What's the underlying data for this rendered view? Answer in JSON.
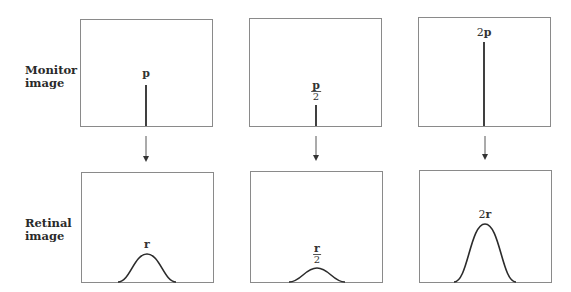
{
  "labels": {
    "monitor": [
      "Monitor",
      "image"
    ],
    "retinal": [
      "Retinal",
      "image"
    ]
  },
  "monitor_panels": [
    {
      "label_var": "p",
      "label_prefix": "",
      "label_denominator": "",
      "spike_x": 146,
      "spike_top": 85
    },
    {
      "label_var": "p",
      "label_prefix": "",
      "label_denominator": "2",
      "spike_x": 316,
      "spike_top": 105
    },
    {
      "label_var": "p",
      "label_prefix": "2",
      "label_denominator": "",
      "spike_x": 484,
      "spike_top": 42
    }
  ],
  "retinal_panels": [
    {
      "label_var": "r",
      "label_prefix": "",
      "label_denominator": "",
      "center_x": 147,
      "peak_y": 254,
      "half_width": 29
    },
    {
      "label_var": "r",
      "label_prefix": "",
      "label_denominator": "2",
      "center_x": 317,
      "peak_y": 268,
      "half_width": 28
    },
    {
      "label_var": "r",
      "label_prefix": "2",
      "label_denominator": "",
      "center_x": 485,
      "peak_y": 224,
      "half_width": 31
    }
  ],
  "colors": {
    "frame": "#8a8a8a",
    "stroke": "#2b2b2b",
    "text": "#333333"
  }
}
